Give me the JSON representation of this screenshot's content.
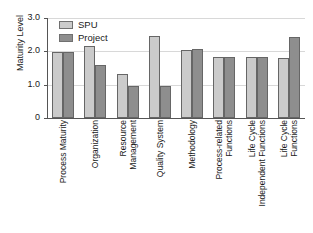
{
  "chart_data": {
    "type": "bar",
    "title": "",
    "subtitle": "",
    "xlabel": "",
    "ylabel": "Maturity Level",
    "ylim": [
      0,
      3.0
    ],
    "yticks": [
      0,
      1.0,
      2.0,
      3.0
    ],
    "ytick_labels": [
      "0",
      "1.0",
      "2.0",
      "3.0"
    ],
    "grid": true,
    "legend_position": "top-left-inside",
    "categories": [
      "Process Maturity",
      "Resource Management",
      "Quality System",
      "Methodology",
      "Process-related Functions",
      "Life Cycle Independent Functions",
      "Life Cycle Functions",
      "Organization"
    ],
    "category_labels": [
      {
        "line1": "Process Maturity",
        "line2": ""
      },
      {
        "line1": "Organization",
        "line2": ""
      },
      {
        "line1": "Resource",
        "line2": "Management"
      },
      {
        "line1": "Quality System",
        "line2": ""
      },
      {
        "line1": "Methodology",
        "line2": ""
      },
      {
        "line1": "Process-related",
        "line2": "Functions"
      },
      {
        "line1": "Life Cycle",
        "line2": "Independent Functions"
      },
      {
        "line1": "Life Cycle",
        "line2": "Functions"
      }
    ],
    "series": [
      {
        "name": "SPU",
        "color": "#cbcbcb",
        "values": [
          1.98,
          2.15,
          1.33,
          2.45,
          2.05,
          1.83,
          1.82,
          1.8
        ]
      },
      {
        "name": "Project",
        "color": "#8e8e8e",
        "values": [
          1.98,
          1.58,
          0.97,
          0.97,
          2.06,
          1.83,
          1.82,
          2.42
        ]
      }
    ]
  },
  "legend": {
    "items": [
      {
        "label": "SPU",
        "color": "#cbcbcb"
      },
      {
        "label": "Project",
        "color": "#8e8e8e"
      }
    ]
  },
  "axes": {
    "y_title": "Maturity Level",
    "y_tick_labels": [
      "3.0",
      "2.0",
      "1.0",
      "0"
    ]
  },
  "colors": {
    "spu": "#cbcbcb",
    "project": "#8e8e8e",
    "axis": "#555555",
    "grid": "#d8d8d8",
    "text": "#1a1a1a",
    "background": "#ffffff"
  }
}
